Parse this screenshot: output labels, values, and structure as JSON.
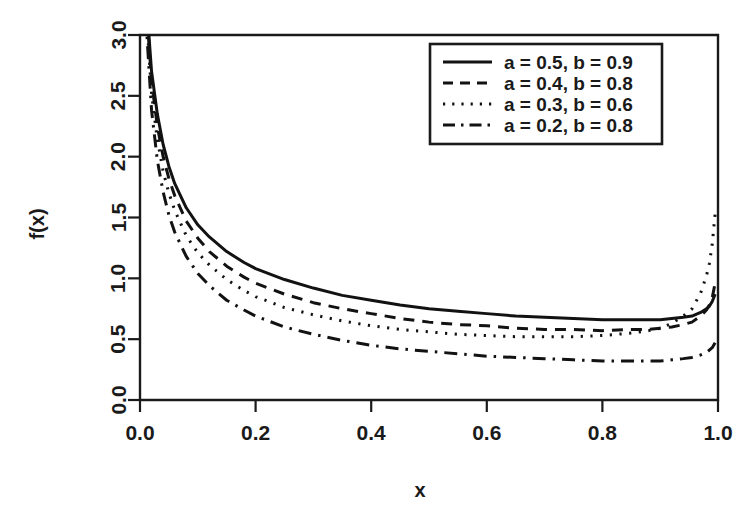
{
  "chart_data": {
    "type": "line",
    "title": "",
    "subtitle": "",
    "xlabel": "x",
    "ylabel": "f(x)",
    "xlim": [
      0.0,
      1.0
    ],
    "ylim": [
      0.0,
      3.0
    ],
    "xticks": [
      "0.0",
      "0.2",
      "0.4",
      "0.6",
      "0.8",
      "1.0"
    ],
    "xtick_values": [
      0.0,
      0.2,
      0.4,
      0.6,
      0.8,
      1.0
    ],
    "yticks": [
      "0.0",
      "0.5",
      "1.0",
      "1.5",
      "2.0",
      "2.5",
      "3.0"
    ],
    "ytick_values": [
      0.0,
      0.5,
      1.0,
      1.5,
      2.0,
      2.5,
      3.0
    ],
    "grid": false,
    "legend_position": "top-right",
    "x": [
      0.01,
      0.02,
      0.03,
      0.04,
      0.05,
      0.06,
      0.08,
      0.1,
      0.12,
      0.15,
      0.18,
      0.2,
      0.25,
      0.3,
      0.35,
      0.4,
      0.45,
      0.5,
      0.55,
      0.6,
      0.65,
      0.7,
      0.75,
      0.8,
      0.85,
      0.88,
      0.9,
      0.92,
      0.94,
      0.955,
      0.97,
      0.98,
      0.985,
      0.99,
      0.995
    ],
    "series": [
      {
        "name": "a = 0.5, b = 0.9",
        "label": "a = 0.5, b = 0.9",
        "a": 0.5,
        "b": 0.9,
        "linestyle": "solid",
        "color": "#121212",
        "values": [
          3.35,
          2.7,
          2.35,
          2.1,
          1.92,
          1.78,
          1.58,
          1.44,
          1.34,
          1.22,
          1.13,
          1.08,
          0.99,
          0.92,
          0.86,
          0.82,
          0.78,
          0.75,
          0.73,
          0.71,
          0.69,
          0.68,
          0.67,
          0.66,
          0.66,
          0.66,
          0.66,
          0.67,
          0.68,
          0.69,
          0.72,
          0.75,
          0.77,
          0.81,
          0.87
        ]
      },
      {
        "name": "a = 0.4, b = 0.8",
        "label": "a = 0.4, b = 0.8",
        "a": 0.4,
        "b": 0.8,
        "linestyle": "dashed",
        "color": "#121212",
        "values": [
          3.3,
          2.62,
          2.25,
          2.0,
          1.82,
          1.68,
          1.47,
          1.33,
          1.22,
          1.1,
          1.01,
          0.96,
          0.87,
          0.8,
          0.75,
          0.71,
          0.67,
          0.64,
          0.62,
          0.61,
          0.59,
          0.58,
          0.58,
          0.57,
          0.58,
          0.58,
          0.59,
          0.6,
          0.62,
          0.64,
          0.69,
          0.74,
          0.78,
          0.84,
          0.96
        ]
      },
      {
        "name": "a = 0.3, b = 0.6",
        "label": "a = 0.3, b = 0.6",
        "a": 0.3,
        "b": 0.6,
        "linestyle": "dotted",
        "color": "#121212",
        "values": [
          3.25,
          2.52,
          2.14,
          1.88,
          1.7,
          1.56,
          1.35,
          1.21,
          1.11,
          0.99,
          0.9,
          0.85,
          0.76,
          0.7,
          0.65,
          0.61,
          0.58,
          0.56,
          0.54,
          0.53,
          0.52,
          0.52,
          0.52,
          0.53,
          0.55,
          0.57,
          0.59,
          0.63,
          0.69,
          0.75,
          0.88,
          1.02,
          1.12,
          1.28,
          1.53
        ]
      },
      {
        "name": "a = 0.2, b = 0.8",
        "label": "a = 0.2, b = 0.8",
        "a": 0.2,
        "b": 0.8,
        "linestyle": "dashdot",
        "color": "#121212",
        "values": [
          3.15,
          2.38,
          1.97,
          1.71,
          1.52,
          1.38,
          1.18,
          1.04,
          0.94,
          0.82,
          0.74,
          0.69,
          0.6,
          0.54,
          0.49,
          0.45,
          0.42,
          0.4,
          0.38,
          0.36,
          0.35,
          0.34,
          0.33,
          0.32,
          0.32,
          0.32,
          0.32,
          0.33,
          0.34,
          0.35,
          0.37,
          0.39,
          0.41,
          0.43,
          0.47
        ]
      }
    ]
  },
  "axes": {
    "y_label": "f(x)",
    "x_label": "x"
  },
  "legend": {
    "items": [
      {
        "label": "a = 0.5, b = 0.9",
        "style": "solid"
      },
      {
        "label": "a = 0.4, b = 0.8",
        "style": "dashed"
      },
      {
        "label": "a = 0.3, b = 0.6",
        "style": "dotted"
      },
      {
        "label": "a = 0.2, b = 0.8",
        "style": "dashdot"
      }
    ]
  },
  "colors": {
    "background": "#ffffff",
    "ink": "#1a1a1a",
    "curve": "#121212"
  }
}
